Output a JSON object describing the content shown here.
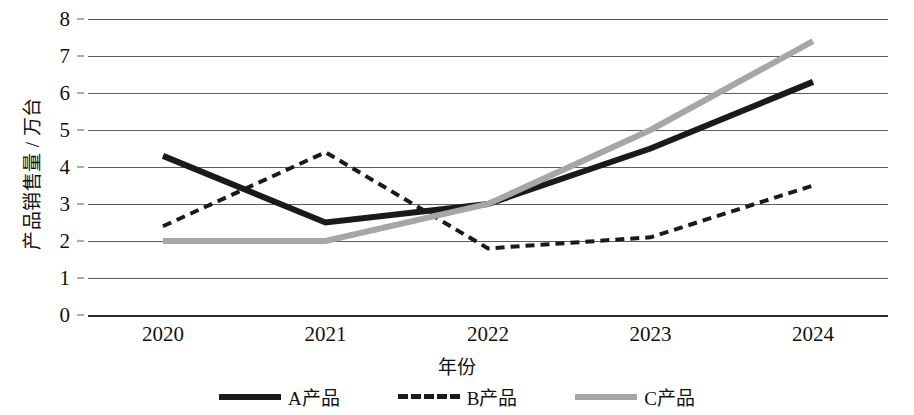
{
  "chart_data": {
    "type": "line",
    "title": "",
    "xlabel": "年份",
    "ylabel": "产品销售量 / 万台",
    "categories": [
      "2020",
      "2021",
      "2022",
      "2023",
      "2024"
    ],
    "x_tick_labels": [
      "2020",
      "2021",
      "2022",
      "2023",
      "2024"
    ],
    "y_tick_labels": [
      "8",
      "7",
      "6",
      "5",
      "4",
      "3",
      "2",
      "1",
      "0"
    ],
    "ylim": [
      0,
      8
    ],
    "ytick_step": 1,
    "grid": "horizontal",
    "legend_position": "bottom",
    "series": [
      {
        "name": "A产品",
        "style": "solid",
        "color": "#1a1a1a",
        "width": 6,
        "values": [
          4.3,
          2.5,
          3.0,
          4.5,
          6.3
        ]
      },
      {
        "name": "B产品",
        "style": "dashed",
        "color": "#1a1a1a",
        "width": 4,
        "values": [
          2.4,
          4.4,
          1.8,
          2.1,
          3.5
        ]
      },
      {
        "name": "C产品",
        "style": "solid",
        "color": "#a6a6a6",
        "width": 6,
        "values": [
          2.0,
          2.0,
          3.0,
          5.0,
          7.4
        ]
      }
    ]
  },
  "legend": {
    "items": [
      {
        "label": "A产品",
        "swatch": "solid-dark"
      },
      {
        "label": "B产品",
        "swatch": "dashed-dark"
      },
      {
        "label": "C产品",
        "swatch": "solid-gray"
      }
    ]
  }
}
